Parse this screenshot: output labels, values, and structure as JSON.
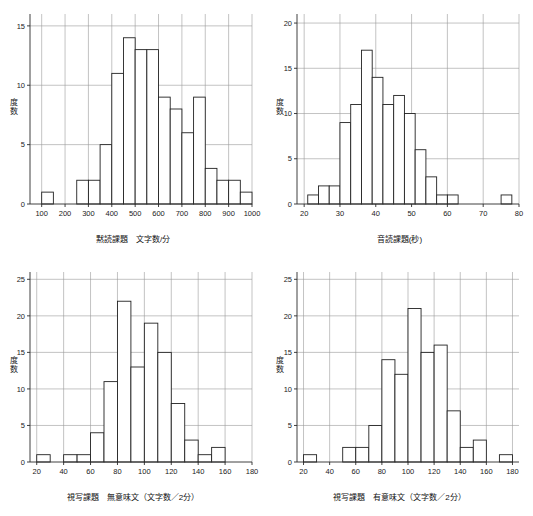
{
  "figure": {
    "caption_partial": "",
    "y_axis_title_chars": [
      "度",
      "数"
    ]
  },
  "chart_data": [
    {
      "type": "bar",
      "panel": "top-left",
      "title": "",
      "xlabel": "黙読課題　文字数/分",
      "ylabel": "度数",
      "xlim": [
        50,
        1000
      ],
      "ylim": [
        0,
        16
      ],
      "xticks": [
        100,
        200,
        300,
        400,
        500,
        600,
        700,
        800,
        900,
        1000
      ],
      "yticks": [
        0,
        5,
        10,
        15
      ],
      "grid": true,
      "bin_width": 50,
      "bin_starts": [
        100,
        250,
        300,
        350,
        400,
        450,
        500,
        550,
        600,
        650,
        700,
        750,
        800,
        850,
        900,
        950
      ],
      "categories": [
        "100-150",
        "250-300",
        "300-350",
        "350-400",
        "400-450",
        "450-500",
        "500-550",
        "550-600",
        "600-650",
        "650-700",
        "700-750",
        "750-800",
        "800-850",
        "850-900",
        "900-950",
        "950-1000"
      ],
      "values": [
        1,
        2,
        2,
        5,
        11,
        14,
        13,
        13,
        9,
        8,
        6,
        9,
        3,
        2,
        2,
        1
      ]
    },
    {
      "type": "bar",
      "panel": "top-right",
      "title": "",
      "xlabel": "音読課題(秒)",
      "ylabel": "度数",
      "xlim": [
        18,
        80
      ],
      "ylim": [
        0,
        21
      ],
      "xticks": [
        20,
        30,
        40,
        50,
        60,
        70,
        80
      ],
      "yticks": [
        0,
        5,
        10,
        15,
        20
      ],
      "grid": true,
      "bin_width": 3,
      "bin_starts": [
        21,
        24,
        27,
        30,
        33,
        36,
        39,
        42,
        45,
        48,
        51,
        54,
        57,
        60,
        75
      ],
      "categories": [
        "21-24",
        "24-27",
        "27-30",
        "30-33",
        "33-36",
        "36-39",
        "39-42",
        "42-45",
        "45-48",
        "48-51",
        "51-54",
        "54-57",
        "57-60",
        "60-63",
        "75-78"
      ],
      "values": [
        1,
        2,
        2,
        9,
        11,
        17,
        14,
        11,
        12,
        10,
        6,
        3,
        1,
        1,
        1
      ]
    },
    {
      "type": "bar",
      "panel": "bottom-left",
      "title": "",
      "xlabel": "視写課題　無意味文（文字数／2分）",
      "ylabel": "度数",
      "xlim": [
        15,
        180
      ],
      "ylim": [
        0,
        26
      ],
      "xticks": [
        20,
        40,
        60,
        80,
        100,
        120,
        140,
        160,
        180
      ],
      "yticks": [
        0,
        5,
        10,
        15,
        20,
        25
      ],
      "grid": true,
      "bin_width": 10,
      "bin_starts": [
        20,
        40,
        50,
        60,
        70,
        80,
        90,
        100,
        110,
        120,
        130,
        140,
        150
      ],
      "categories": [
        "20-30",
        "40-50",
        "50-60",
        "60-70",
        "70-80",
        "80-90",
        "90-100",
        "100-110",
        "110-120",
        "120-130",
        "130-140",
        "140-150",
        "150-160"
      ],
      "values": [
        1,
        1,
        1,
        4,
        11,
        22,
        13,
        19,
        15,
        8,
        3,
        1,
        2
      ]
    },
    {
      "type": "bar",
      "panel": "bottom-right",
      "title": "",
      "xlabel": "視写課題　有意味文（文字数／2分）",
      "ylabel": "度数",
      "xlim": [
        15,
        185
      ],
      "ylim": [
        0,
        26
      ],
      "xticks": [
        20,
        40,
        60,
        80,
        100,
        120,
        140,
        160,
        180
      ],
      "yticks": [
        0,
        5,
        10,
        15,
        20,
        25
      ],
      "grid": true,
      "bin_width": 10,
      "bin_starts": [
        20,
        50,
        60,
        70,
        80,
        90,
        100,
        110,
        120,
        130,
        140,
        150,
        170
      ],
      "categories": [
        "20-30",
        "50-60",
        "60-70",
        "70-80",
        "80-90",
        "90-100",
        "100-110",
        "110-120",
        "120-130",
        "130-140",
        "140-150",
        "150-160",
        "170-180"
      ],
      "values": [
        1,
        2,
        2,
        5,
        14,
        12,
        21,
        15,
        16,
        7,
        2,
        3,
        1
      ]
    }
  ]
}
